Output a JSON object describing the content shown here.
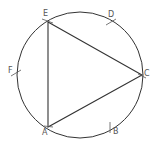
{
  "diagram": {
    "colors": {
      "stroke": "#333333",
      "label": "#555555",
      "background": "#ffffff"
    },
    "circle": {
      "cx": 80,
      "cy": 75,
      "r": 63
    },
    "triangle": {
      "vertices": [
        "E",
        "C",
        "A"
      ]
    },
    "points": [
      {
        "name": "E",
        "label": "E",
        "x": 48,
        "y": 22,
        "lx": 43,
        "ly": 10
      },
      {
        "name": "D",
        "label": "D",
        "x": 111,
        "y": 23,
        "lx": 108,
        "ly": 11
      },
      {
        "name": "C",
        "label": "C",
        "x": 142,
        "y": 75,
        "lx": 144,
        "ly": 70
      },
      {
        "name": "B",
        "label": "B",
        "x": 110,
        "y": 127,
        "lx": 113,
        "ly": 128
      },
      {
        "name": "A",
        "label": "A",
        "x": 48,
        "y": 127,
        "lx": 42,
        "ly": 129
      },
      {
        "name": "F",
        "label": "F",
        "x": 16,
        "y": 73,
        "lx": 8,
        "ly": 67
      }
    ]
  }
}
